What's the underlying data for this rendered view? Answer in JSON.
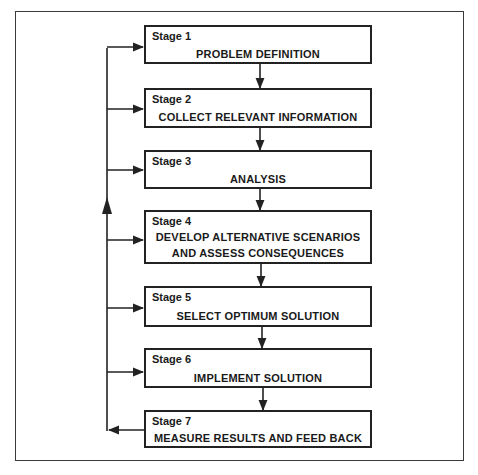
{
  "diagram": {
    "type": "flowchart",
    "stages": [
      {
        "label": "Stage 1",
        "title": [
          "PROBLEM DEFINITION"
        ]
      },
      {
        "label": "Stage 2",
        "title": [
          "COLLECT RELEVANT INFORMATION"
        ]
      },
      {
        "label": "Stage 3",
        "title": [
          "ANALYSIS"
        ]
      },
      {
        "label": "Stage 4",
        "title": [
          "DEVELOP ALTERNATIVE SCENARIOS",
          "AND ASSESS CONSEQUENCES"
        ]
      },
      {
        "label": "Stage 5",
        "title": [
          "SELECT OPTIMUM SOLUTION"
        ]
      },
      {
        "label": "Stage 6",
        "title": [
          "IMPLEMENT SOLUTION"
        ]
      },
      {
        "label": "Stage 7",
        "title": [
          "MEASURE RESULTS AND FEED BACK"
        ]
      }
    ],
    "edges": [
      {
        "from": "Stage 1",
        "to": "Stage 2",
        "kind": "sequence"
      },
      {
        "from": "Stage 2",
        "to": "Stage 3",
        "kind": "sequence"
      },
      {
        "from": "Stage 3",
        "to": "Stage 4",
        "kind": "sequence"
      },
      {
        "from": "Stage 4",
        "to": "Stage 5",
        "kind": "sequence"
      },
      {
        "from": "Stage 5",
        "to": "Stage 6",
        "kind": "sequence"
      },
      {
        "from": "Stage 6",
        "to": "Stage 7",
        "kind": "sequence"
      },
      {
        "from": "Stage 7",
        "to": "feedback-loop",
        "kind": "feedback"
      },
      {
        "from": "feedback-loop",
        "to": "Stage 1",
        "kind": "feedback"
      },
      {
        "from": "feedback-loop",
        "to": "Stage 2",
        "kind": "feedback"
      },
      {
        "from": "feedback-loop",
        "to": "Stage 3",
        "kind": "feedback"
      },
      {
        "from": "feedback-loop",
        "to": "Stage 4",
        "kind": "feedback"
      },
      {
        "from": "feedback-loop",
        "to": "Stage 5",
        "kind": "feedback"
      },
      {
        "from": "feedback-loop",
        "to": "Stage 6",
        "kind": "feedback"
      }
    ],
    "colors": {
      "line": "#222222",
      "frame": "#3a3a3a",
      "background": "#ffffff"
    }
  }
}
